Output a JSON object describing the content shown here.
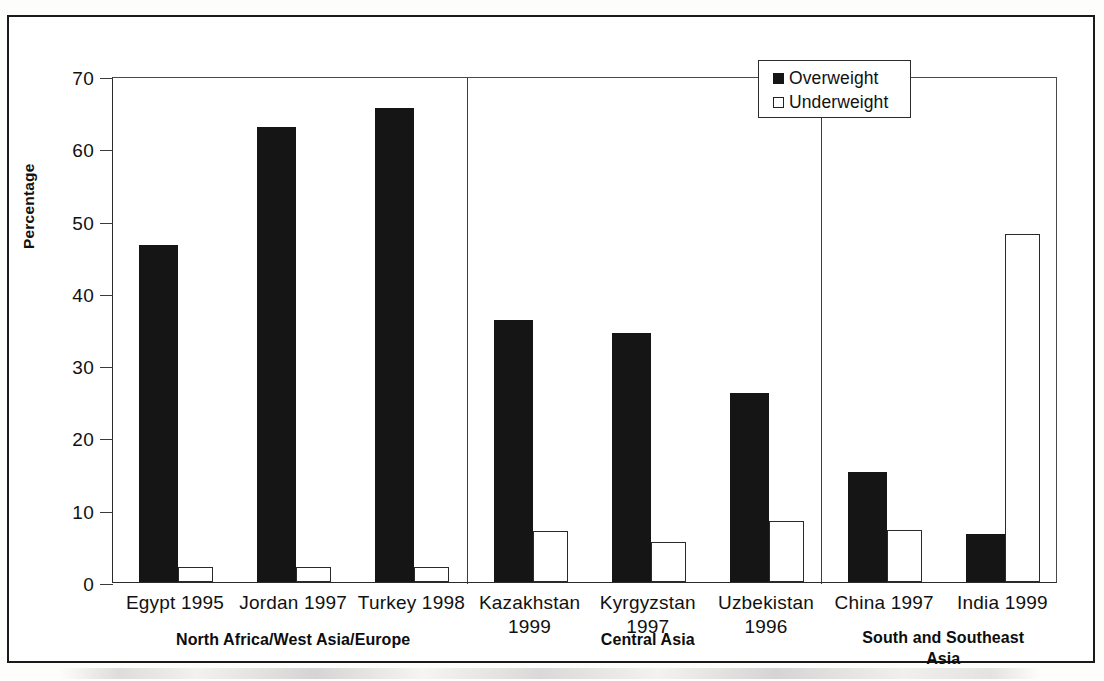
{
  "chart_data": {
    "type": "bar",
    "title": "",
    "xlabel": "",
    "ylabel": "Percentage",
    "ylim": [
      0,
      70
    ],
    "yticks": [
      "0",
      "10",
      "20",
      "30",
      "40",
      "50",
      "60",
      "70"
    ],
    "grid": false,
    "legend_position": "top-right-inside",
    "categories": [
      "Egypt 1995",
      "Jordan 1997",
      "Turkey 1998",
      "Kazakhstan 1999",
      "Kyrgyzstan 1997",
      "Uzbekistan 1996",
      "China 1997",
      "India 1999"
    ],
    "series": [
      {
        "name": "Overweight",
        "color": "#151515",
        "values": [
          46.6,
          63,
          65.6,
          36.3,
          34.5,
          26.1,
          15.2,
          5.6
        ],
        "labels": [
          "46.6",
          "63",
          "65.6",
          "36.3",
          "34.5",
          "26.1",
          "15.2",
          "5.6"
        ]
      },
      {
        "name": "Underweight",
        "color": "#ffffff",
        "values": [
          1.8,
          1.8,
          1.5,
          6,
          4.4,
          7.4,
          6.1,
          48.2
        ],
        "labels": [
          "1.8",
          "1.8",
          "1.5",
          "6",
          "4.4",
          "7.4",
          "6.1",
          "48.2"
        ]
      }
    ],
    "groups": [
      {
        "label": "North Africa/West Asia/Europe",
        "categories": [
          "Egypt 1995",
          "Jordan 1997",
          "Turkey 1998"
        ]
      },
      {
        "label": "Central Asia",
        "categories": [
          "Kazakhstan 1999",
          "Kyrgyzstan 1997",
          "Uzbekistan 1996"
        ]
      },
      {
        "label": "South and Southeast Asia",
        "categories": [
          "China 1997",
          "India 1999"
        ]
      }
    ]
  },
  "axis": {
    "y_title": "Percentage",
    "y_ticks": [
      {
        "value": 70,
        "label": "70"
      },
      {
        "value": 60,
        "label": "60"
      },
      {
        "value": 50,
        "label": "50"
      },
      {
        "value": 40,
        "label": "40"
      },
      {
        "value": 30,
        "label": "30"
      },
      {
        "value": 20,
        "label": "20"
      },
      {
        "value": 10,
        "label": "10"
      },
      {
        "value": 0,
        "label": "0"
      }
    ]
  },
  "legend": {
    "items": [
      {
        "label": "Overweight",
        "swatch": "filled-square-icon"
      },
      {
        "label": "Underweight",
        "swatch": "hollow-square-icon"
      }
    ]
  },
  "x_labels": [
    {
      "line1": "Egypt 1995",
      "line2": ""
    },
    {
      "line1": "Jordan 1997",
      "line2": ""
    },
    {
      "line1": "Turkey 1998",
      "line2": ""
    },
    {
      "line1": "Kazakhstan",
      "line2": "1999"
    },
    {
      "line1": "Kyrgyzstan",
      "line2": "1997"
    },
    {
      "line1": "Uzbekistan",
      "line2": "1996"
    },
    {
      "line1": "China 1997",
      "line2": ""
    },
    {
      "line1": "India 1999",
      "line2": ""
    }
  ],
  "group_labels": [
    {
      "line1": "North Africa/West Asia/Europe",
      "line2": ""
    },
    {
      "line1": "Central Asia",
      "line2": ""
    },
    {
      "line1": "South and Southeast",
      "line2": "Asia"
    }
  ],
  "colors": {
    "overweight": "#151515",
    "underweight": "#ffffff",
    "axis": "#2b2b2b",
    "frame": "#1a1a1a"
  }
}
